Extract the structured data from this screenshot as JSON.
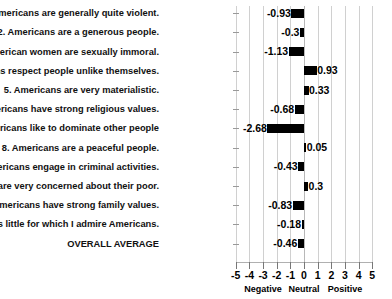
{
  "chart_data": {
    "type": "bar",
    "orientation": "horizontal",
    "title": "",
    "xlabel": "",
    "ylabel": "",
    "xlim": [
      -5,
      5
    ],
    "grid": true,
    "legend": false,
    "xticks": [
      "-5",
      "-4",
      "-3",
      "-2",
      "-1",
      "0",
      "1",
      "2",
      "3",
      "4",
      "5"
    ],
    "zone_labels": [
      "Negative",
      "Neutral",
      "Positive"
    ],
    "categories": [
      "1. Americans are generally quite violent.",
      "2. Americans are a generous people.",
      "3. Many American women are sexually immoral.",
      "4. Americans respect people unlike themselves.",
      "5. Americans are very materialistic.",
      "6. Americans have strong religious values.",
      "7. Americans like to dominate other people",
      "8. Americans are a peaceful people.",
      "9. Many Americans engage in criminal activities.",
      "10. Americans are very concerned about their poor.",
      "11. Americans have strong family values.",
      "12. There is little for which I admire Americans.",
      "OVERALL AVERAGE"
    ],
    "values": [
      -0.93,
      -0.3,
      -1.13,
      0.93,
      0.33,
      -0.68,
      -2.68,
      0.05,
      -0.43,
      0.3,
      -0.83,
      -0.18,
      -0.46
    ],
    "value_labels": [
      "-0.93",
      "-0.3",
      "-1.13",
      "0.93",
      "0.33",
      "-0.68",
      "-2.68",
      "0.05",
      "-0.43",
      "0.3",
      "-0.83",
      "-0.18",
      "-0.46"
    ],
    "bar_color": "#000000",
    "grid_color": "#d0d0d0"
  }
}
